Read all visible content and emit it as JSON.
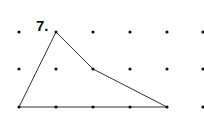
{
  "figure": {
    "problem_number": "7.",
    "grid": {
      "columns_x": [
        19,
        56,
        93,
        130,
        167,
        203
      ],
      "rows_y": [
        32,
        69,
        107
      ],
      "dot_color": "#111111",
      "dot_radius": 1.6
    },
    "polygon": {
      "description": "Concave quadrilateral (triangle-like shape) drawn on dot grid",
      "vertices_grid": [
        [
          0,
          2
        ],
        [
          1,
          0
        ],
        [
          2,
          1
        ],
        [
          4,
          2
        ]
      ],
      "stroke_color": "#333333",
      "stroke_width": 1
    }
  }
}
